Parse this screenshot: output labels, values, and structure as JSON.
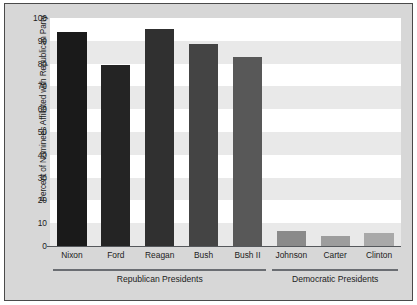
{
  "chart_data": {
    "type": "bar",
    "title": "",
    "xlabel": "",
    "ylabel": "Percent of Nominees Affiliated with Republican Party",
    "ylim": [
      0,
      100
    ],
    "yticks": [
      0,
      10,
      20,
      30,
      40,
      50,
      60,
      70,
      80,
      90,
      100
    ],
    "grid": "alternating-horizontal-bands",
    "legend": "none",
    "categories": [
      "Nixon",
      "Ford",
      "Reagan",
      "Bush",
      "Bush II",
      "Johnson",
      "Carter",
      "Clinton"
    ],
    "values": [
      94,
      79.5,
      95,
      88.5,
      83,
      6.5,
      4.5,
      5.5
    ],
    "bar_colors": [
      "#1a1a1a",
      "#242424",
      "#303030",
      "#444444",
      "#585858",
      "#8a8a8a",
      "#9d9d9d",
      "#a9a9a9"
    ],
    "groups": [
      {
        "label": "Republican Presidents",
        "categories": [
          "Nixon",
          "Ford",
          "Reagan",
          "Bush",
          "Bush II"
        ]
      },
      {
        "label": "Democratic Presidents",
        "categories": [
          "Johnson",
          "Carter",
          "Clinton"
        ]
      }
    ]
  },
  "style": {
    "figure_background": "#d7d7d7",
    "plot_background": "#ffffff",
    "band_color": "#e9e9e9",
    "axis_color": "#55585c",
    "rule_color": "#6a6d72",
    "text_color": "#1c1c1c"
  }
}
